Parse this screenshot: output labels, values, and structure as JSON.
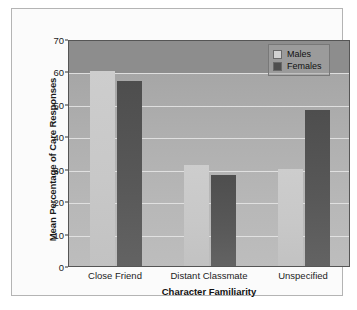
{
  "chart_data": {
    "type": "bar",
    "title": "",
    "xlabel": "Character Familiarity",
    "ylabel": "Mean Percentage of Care Responses",
    "categories": [
      "Close Friend",
      "Distant Classmate",
      "Unspecified"
    ],
    "series": [
      {
        "name": "Males",
        "color": "#c8c8c8",
        "values": [
          60,
          31,
          30
        ]
      },
      {
        "name": "Females",
        "color": "#585858",
        "values": [
          57,
          28,
          48
        ]
      }
    ],
    "ylim": [
      0,
      70
    ],
    "yticks": [
      0,
      10,
      20,
      30,
      40,
      50,
      60,
      70
    ],
    "grid": true,
    "legend_position": "top-right",
    "plot_background": "#b0b0b0",
    "figure_background": "#ffffff"
  },
  "legend": {
    "items": [
      {
        "label": "Males"
      },
      {
        "label": "Females"
      }
    ]
  }
}
